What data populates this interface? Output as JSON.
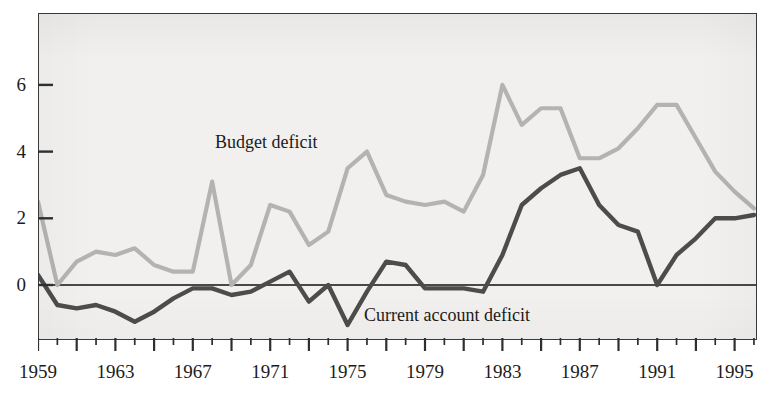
{
  "figure": {
    "top_caption_fragment": "",
    "background_color": "#f1f0ee",
    "frame_color": "#3a3a3a"
  },
  "series_labels": {
    "budget": "Budget deficit",
    "current_account": "Current account deficit"
  },
  "colors": {
    "budget_deficit": "#b4b3b1",
    "current_account_deficit": "#4c4c4c",
    "zero_line": "#111111",
    "axis": "#2f2f2f"
  },
  "axes": {
    "y_tick_labels": [
      "0",
      "2",
      "4",
      "6"
    ],
    "y_tick_values": [
      0,
      2,
      4,
      6
    ],
    "x_tick_labels": [
      "1959",
      "1963",
      "1967",
      "1971",
      "1975",
      "1979",
      "1983",
      "1987",
      "1991",
      "1995"
    ],
    "x_tick_values": [
      1959,
      1963,
      1967,
      1971,
      1975,
      1979,
      1983,
      1987,
      1991,
      1995
    ]
  },
  "chart_data": {
    "type": "line",
    "title": "",
    "xlabel": "",
    "ylabel": "",
    "xlim": [
      1959,
      1996
    ],
    "ylim": [
      -1.6,
      7.9
    ],
    "grid": false,
    "legend": "inline-annotations",
    "annotations": [
      {
        "text": "Budget deficit",
        "x": 1968,
        "y": 4.6
      },
      {
        "text": "Current account deficit",
        "x": 1976,
        "y": -0.9
      }
    ],
    "x": [
      1959,
      1960,
      1961,
      1962,
      1963,
      1964,
      1965,
      1966,
      1967,
      1968,
      1969,
      1970,
      1971,
      1972,
      1973,
      1974,
      1975,
      1976,
      1977,
      1978,
      1979,
      1980,
      1981,
      1982,
      1983,
      1984,
      1985,
      1986,
      1987,
      1988,
      1989,
      1990,
      1991,
      1992,
      1993,
      1994,
      1995,
      1996
    ],
    "series": [
      {
        "name": "Budget deficit",
        "color": "#b4b3b1",
        "values": [
          2.5,
          0.0,
          0.7,
          1.0,
          0.9,
          1.1,
          0.6,
          0.4,
          0.4,
          3.1,
          0.0,
          0.6,
          2.4,
          2.2,
          1.2,
          1.6,
          3.5,
          4.0,
          2.7,
          2.5,
          2.4,
          2.5,
          2.2,
          3.3,
          6.0,
          4.8,
          5.3,
          5.3,
          3.8,
          3.8,
          4.1,
          4.7,
          5.4,
          5.4,
          4.4,
          3.4,
          2.8,
          2.3
        ]
      },
      {
        "name": "Current account deficit",
        "color": "#4c4c4c",
        "values": [
          0.3,
          -0.6,
          -0.7,
          -0.6,
          -0.8,
          -1.1,
          -0.8,
          -0.4,
          -0.1,
          -0.1,
          -0.3,
          -0.2,
          0.1,
          0.4,
          -0.5,
          0.0,
          -1.2,
          -0.2,
          0.7,
          0.6,
          -0.1,
          -0.1,
          -0.1,
          -0.2,
          0.9,
          2.4,
          2.9,
          3.3,
          3.5,
          2.4,
          1.8,
          1.6,
          0.0,
          0.9,
          1.4,
          2.0,
          2.0,
          2.1
        ]
      }
    ]
  }
}
